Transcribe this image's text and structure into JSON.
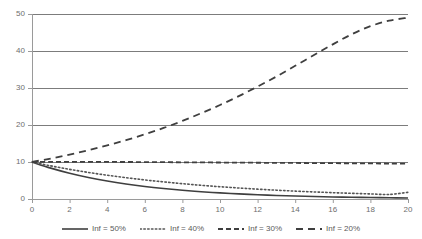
{
  "chart_data": {
    "type": "line",
    "title": "",
    "xlabel": "",
    "ylabel": "",
    "xlim": [
      0,
      20
    ],
    "ylim": [
      0,
      50
    ],
    "grid": true,
    "grid_axis": "y",
    "legend_position": "bottom",
    "x_ticks": [
      "0",
      "2",
      "4",
      "6",
      "8",
      "10",
      "12",
      "14",
      "16",
      "18",
      "20"
    ],
    "x_tick_values": [
      0,
      2,
      4,
      6,
      8,
      10,
      12,
      14,
      16,
      18,
      20
    ],
    "y_ticks": [
      "0",
      "10",
      "20",
      "30",
      "40",
      "50"
    ],
    "y_tick_values": [
      0,
      10,
      20,
      30,
      40,
      50
    ],
    "x": [
      0,
      1,
      2,
      3,
      4,
      5,
      6,
      7,
      8,
      9,
      10,
      11,
      12,
      13,
      14,
      15,
      16,
      17,
      18,
      19,
      20
    ],
    "series": [
      {
        "name": "Inf = 50%",
        "style": "solid",
        "color": "#3f3f3f",
        "width": 1.6,
        "values": [
          10.0,
          8.35,
          6.97,
          5.82,
          4.86,
          4.06,
          3.39,
          2.83,
          2.36,
          1.97,
          1.65,
          1.38,
          1.15,
          0.96,
          0.8,
          0.67,
          0.56,
          0.47,
          0.39,
          0.33,
          0.25
        ]
      },
      {
        "name": "Inf = 40%",
        "style": "dotted",
        "color": "#555555",
        "width": 1.6,
        "values": [
          10.0,
          8.95,
          8.02,
          7.18,
          6.43,
          5.76,
          5.16,
          4.62,
          4.14,
          3.7,
          3.32,
          2.97,
          2.66,
          2.38,
          2.13,
          1.91,
          1.71,
          1.53,
          1.37,
          1.23,
          1.8
        ]
      },
      {
        "name": "Inf = 30%",
        "style": "dashed",
        "color": "#3f3f3f",
        "width": 1.8,
        "values": [
          10.0,
          10.02,
          10.03,
          10.03,
          10.02,
          10.0,
          9.98,
          9.95,
          9.92,
          9.89,
          9.86,
          9.83,
          9.8,
          9.77,
          9.74,
          9.71,
          9.68,
          9.65,
          9.62,
          9.58,
          9.55
        ]
      },
      {
        "name": "Inf = 20%",
        "style": "longdash",
        "color": "#3f3f3f",
        "width": 1.8,
        "values": [
          10.0,
          10.95,
          12.0,
          13.2,
          14.5,
          15.9,
          17.5,
          19.2,
          21.1,
          23.2,
          25.4,
          27.8,
          30.4,
          33.1,
          36.0,
          38.9,
          41.8,
          44.5,
          46.7,
          48.2,
          49.0
        ]
      }
    ]
  },
  "axes": {
    "axis_color": "#9a9a9a",
    "grid_color": "#7c7c7c",
    "tick_label_color": "#6e6e6e"
  }
}
